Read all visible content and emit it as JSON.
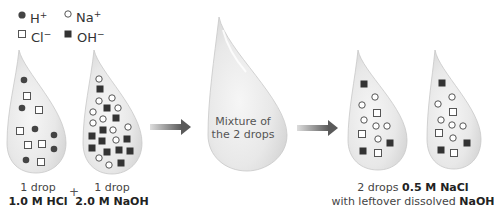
{
  "legend": {
    "items": [
      {
        "symbol": "filled-circle",
        "label": "H",
        "charge": "+"
      },
      {
        "symbol": "open-circle",
        "label": "Na",
        "charge": "+"
      },
      {
        "symbol": "open-square",
        "label": "Cl",
        "charge": "−"
      },
      {
        "symbol": "filled-square",
        "label": "OH",
        "charge": "−"
      }
    ]
  },
  "drops": [
    {
      "id": "hcl-drop",
      "caption_line1": "1 drop",
      "caption_line2": "1.0 M HCl"
    },
    {
      "id": "naoh-drop",
      "caption_line1": "1 drop",
      "caption_line2": "2.0 M NaOH"
    },
    {
      "id": "mixture-drop",
      "text_line1": "Mixture of",
      "text_line2": "the 2 drops"
    },
    {
      "id": "nacl-drop-1"
    },
    {
      "id": "nacl-drop-2"
    }
  ],
  "plus_sign": "+",
  "result_caption": {
    "line1_prefix": "2 drops ",
    "line1_bold": "0.5 M NaCl",
    "line2_prefix": "with leftover dissolved ",
    "line2_bold": "NaOH"
  },
  "colors": {
    "drop_fill": "#e6e6e6",
    "drop_edge": "#c4c4c4",
    "ion_dark": "#333333",
    "arrow": "#666666"
  }
}
